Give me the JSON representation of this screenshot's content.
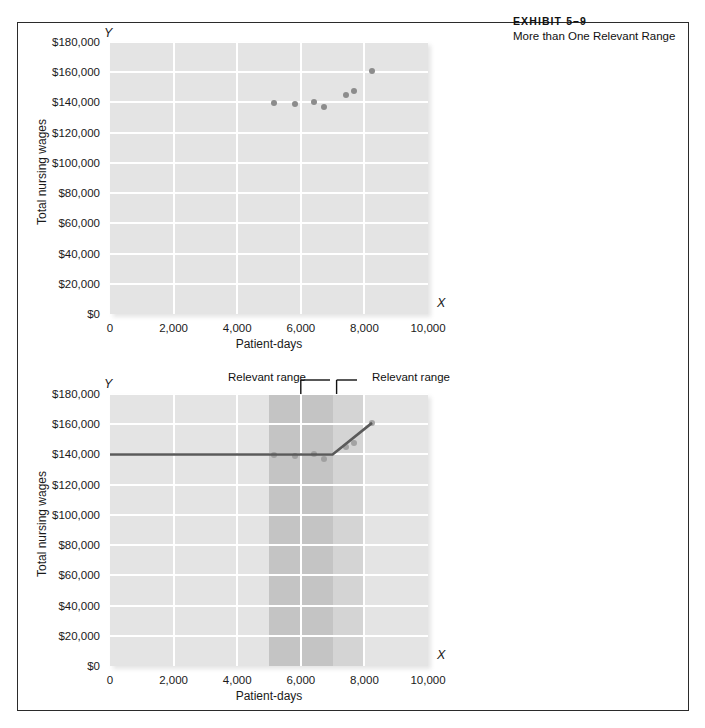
{
  "exhibit": {
    "number_label": "EXHIBIT 5–9",
    "title": "More than One Relevant Range"
  },
  "chart_data": [
    {
      "id": "top",
      "type": "scatter",
      "title": "",
      "xlabel": "Patient-days",
      "ylabel": "Total nursing wages",
      "x_axis_letter": "X",
      "y_axis_letter": "Y",
      "xlim": [
        0,
        10000
      ],
      "ylim": [
        0,
        180000
      ],
      "xticks": [
        0,
        2000,
        4000,
        6000,
        8000,
        10000
      ],
      "xticklabels": [
        "0",
        "2,000",
        "4,000",
        "6,000",
        "8,000",
        "10,000"
      ],
      "yticks": [
        0,
        20000,
        40000,
        60000,
        80000,
        100000,
        120000,
        140000,
        160000,
        180000
      ],
      "yticklabels": [
        "$0",
        "$20,000",
        "$40,000",
        "$60,000",
        "$80,000",
        "$100,000",
        "$120,000",
        "$140,000",
        "$160,000",
        "$180,000"
      ],
      "grid": true,
      "legend": "none",
      "points": [
        {
          "x": 5150,
          "y": 139800
        },
        {
          "x": 5820,
          "y": 138700
        },
        {
          "x": 6420,
          "y": 140200
        },
        {
          "x": 6720,
          "y": 137300
        },
        {
          "x": 7430,
          "y": 145100
        },
        {
          "x": 7670,
          "y": 147600
        },
        {
          "x": 8240,
          "y": 160900
        }
      ]
    },
    {
      "id": "bottom",
      "type": "line",
      "title": "",
      "xlabel": "Patient-days",
      "ylabel": "Total nursing wages",
      "x_axis_letter": "X",
      "y_axis_letter": "Y",
      "xlim": [
        0,
        10000
      ],
      "ylim": [
        0,
        180000
      ],
      "xticks": [
        0,
        2000,
        4000,
        6000,
        8000,
        10000
      ],
      "xticklabels": [
        "0",
        "2,000",
        "4,000",
        "6,000",
        "8,000",
        "10,000"
      ],
      "yticks": [
        0,
        20000,
        40000,
        60000,
        80000,
        100000,
        120000,
        140000,
        160000,
        180000
      ],
      "yticklabels": [
        "$0",
        "$20,000",
        "$40,000",
        "$60,000",
        "$80,000",
        "$100,000",
        "$120,000",
        "$140,000",
        "$160,000",
        "$180,000"
      ],
      "grid": true,
      "legend": "none",
      "cost_line": [
        {
          "x": 0,
          "y": 140000
        },
        {
          "x": 7000,
          "y": 140000
        },
        {
          "x": 8240,
          "y": 160900
        }
      ],
      "points": [
        {
          "x": 5150,
          "y": 139800
        },
        {
          "x": 5820,
          "y": 138700
        },
        {
          "x": 6420,
          "y": 140200
        },
        {
          "x": 6720,
          "y": 137300
        },
        {
          "x": 7430,
          "y": 145100
        },
        {
          "x": 7670,
          "y": 147600
        },
        {
          "x": 8240,
          "y": 160900
        }
      ],
      "relevant_ranges": [
        {
          "label": "Relevant range",
          "x_start": 5000,
          "x_end": 7000
        },
        {
          "label": "Relevant range",
          "x_start": 7000,
          "x_end": 8000
        }
      ]
    }
  ]
}
